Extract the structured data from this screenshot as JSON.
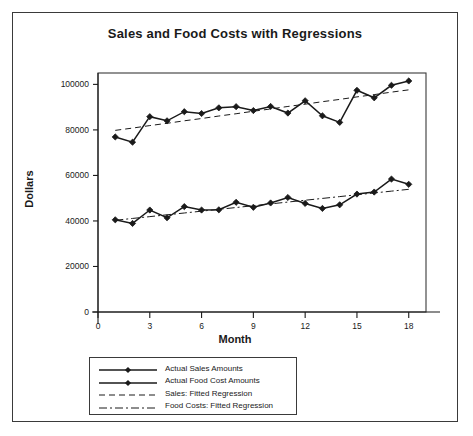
{
  "figure": {
    "title": "Sales and Food Costs with Regressions"
  },
  "chart_data": {
    "type": "line",
    "title": "Sales and Food Costs with Regressions",
    "xlabel": "Month",
    "ylabel": "Dollars",
    "xlim": [
      0,
      19
    ],
    "ylim": [
      0,
      105000
    ],
    "xticks": [
      0,
      3,
      6,
      9,
      12,
      15,
      18
    ],
    "xticklabels": [
      "0",
      "3",
      "6",
      "9",
      "12",
      "15",
      "18"
    ],
    "yticks": [
      0,
      20000,
      40000,
      60000,
      80000,
      100000
    ],
    "yticklabels": [
      "0",
      "20000",
      "40000",
      "60000",
      "80000",
      "100000"
    ],
    "grid": false,
    "legend_position": "below-axes",
    "x": [
      1,
      2,
      3,
      4,
      5,
      6,
      7,
      8,
      9,
      10,
      11,
      12,
      13,
      14,
      15,
      16,
      17,
      18
    ],
    "series": [
      {
        "name": "Actual Sales Amounts",
        "style": "solid-with-diamond-markers",
        "values": [
          76900,
          74600,
          85800,
          84000,
          88000,
          87200,
          89700,
          90200,
          88500,
          90300,
          87400,
          92800,
          86200,
          83300,
          97400,
          94100,
          99600,
          101500
        ]
      },
      {
        "name": "Actual Food Cost Amounts",
        "style": "solid-with-diamond-markers",
        "values": [
          40500,
          38900,
          44800,
          41400,
          46300,
          44800,
          44900,
          48200,
          46000,
          47900,
          50300,
          47700,
          45500,
          47100,
          51800,
          52700,
          58400,
          56100
        ]
      },
      {
        "name": "Sales: Fitted Regression",
        "style": "dashed",
        "values": [
          79800,
          80800,
          81900,
          82900,
          84000,
          85000,
          86100,
          87100,
          88200,
          89200,
          90300,
          91300,
          92400,
          93400,
          94500,
          95500,
          96600,
          97600
        ]
      },
      {
        "name": "Food Costs: Fitted Regression",
        "style": "dash-dot",
        "values": [
          40300,
          41100,
          41900,
          42700,
          43500,
          44300,
          45100,
          45900,
          46700,
          47500,
          48300,
          49100,
          49900,
          50700,
          51500,
          52300,
          53100,
          53900
        ]
      }
    ],
    "legend": [
      {
        "label": "Actual Sales Amounts",
        "key": "line-marker"
      },
      {
        "label": "Actual Food Cost Amounts",
        "key": "line-marker"
      },
      {
        "label": "Sales: Fitted Regression",
        "key": "dashed-line"
      },
      {
        "label": "Food Costs: Fitted Regression",
        "key": "dash-dot-line"
      }
    ]
  },
  "colors": {
    "line": "#1a1a1a",
    "frame": "#3a3a3a",
    "background": "#ffffff"
  }
}
